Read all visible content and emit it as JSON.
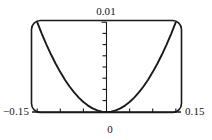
{
  "figure": {
    "name": "parabola-plot",
    "frame": {
      "style": "rounded-rectangle",
      "stroke_color": "#1a1a1a"
    },
    "labels": {
      "y_max": "0.01",
      "x_min": "−0.15",
      "x_max": "0.15",
      "x_zero": "0"
    }
  },
  "chart_data": {
    "type": "line",
    "title": "",
    "xlabel": "",
    "ylabel": "",
    "xlim": [
      -0.15,
      0.15
    ],
    "ylim": [
      0,
      0.01
    ],
    "grid": false,
    "legend": false,
    "axis_style": "cross-axes-with-ticks",
    "x_tick_labels": [
      "−0.15",
      "0",
      "0.15"
    ],
    "y_tick_labels": [
      "0.01"
    ],
    "x_ticks": [
      -0.15,
      -0.1,
      -0.05,
      0,
      0.05,
      0.1,
      0.15
    ],
    "y_ticks": [
      0,
      0.00125,
      0.0025,
      0.00375,
      0.005,
      0.00625,
      0.0075,
      0.00875,
      0.01
    ],
    "series": [
      {
        "name": "curve",
        "color": "#1a1a1a",
        "x": [
          -0.15,
          -0.14,
          -0.13,
          -0.12,
          -0.11,
          -0.1,
          -0.09,
          -0.08,
          -0.07,
          -0.06,
          -0.05,
          -0.04,
          -0.03,
          -0.02,
          -0.01,
          0,
          0.01,
          0.02,
          0.03,
          0.04,
          0.05,
          0.06,
          0.07,
          0.08,
          0.09,
          0.1,
          0.11,
          0.12,
          0.13,
          0.14,
          0.15
        ],
        "y": [
          0.01,
          0.008711,
          0.007511,
          0.0064,
          0.005378,
          0.004444,
          0.0036,
          0.002844,
          0.002178,
          0.0016,
          0.001111,
          0.000711,
          0.0004,
          0.000178,
          4.4e-05,
          0,
          4.4e-05,
          0.000178,
          0.0004,
          0.000711,
          0.001111,
          0.0016,
          0.002178,
          0.002844,
          0.0036,
          0.004444,
          0.005378,
          0.0064,
          0.007511,
          0.008711,
          0.01
        ]
      }
    ]
  }
}
